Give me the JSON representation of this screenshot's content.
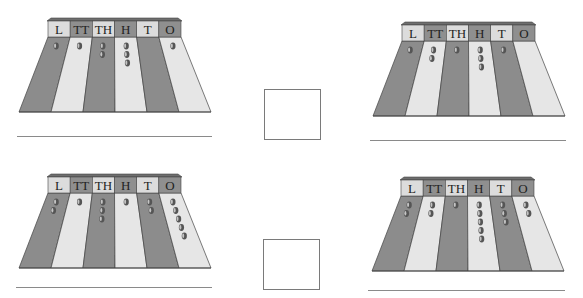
{
  "worksheet": {
    "place_value_labels": [
      "L",
      "TT",
      "TH",
      "H",
      "T",
      "O"
    ],
    "colors": {
      "dark_column": "#8c8c8c",
      "light_column": "#e6e6e6",
      "dark_label": "#8f8f8f",
      "light_label": "#dcdcdc",
      "header_top": "#6e6e6e",
      "bead": "#555555",
      "outline": "#444444"
    },
    "abaci": [
      {
        "id": "top-left",
        "x": 19,
        "y": 18,
        "beads": [
          1,
          1,
          2,
          3,
          0,
          1
        ]
      },
      {
        "id": "top-right",
        "x": 373,
        "y": 22,
        "beads": [
          1,
          2,
          1,
          3,
          1,
          0
        ]
      },
      {
        "id": "bottom-left",
        "x": 19,
        "y": 174,
        "beads": [
          2,
          1,
          3,
          1,
          2,
          5
        ]
      },
      {
        "id": "bottom-right",
        "x": 372,
        "y": 177,
        "beads": [
          2,
          2,
          1,
          5,
          3,
          2
        ]
      }
    ],
    "answer_lines": [
      {
        "x": 17,
        "y": 136,
        "w": 195
      },
      {
        "x": 370,
        "y": 140,
        "w": 196
      },
      {
        "x": 16,
        "y": 287,
        "w": 196
      },
      {
        "x": 368,
        "y": 290,
        "w": 197
      }
    ],
    "answer_boxes": [
      {
        "x": 264,
        "y": 89,
        "w": 57,
        "h": 51,
        "value": ""
      },
      {
        "x": 263,
        "y": 239,
        "w": 57,
        "h": 51,
        "value": ""
      }
    ]
  }
}
